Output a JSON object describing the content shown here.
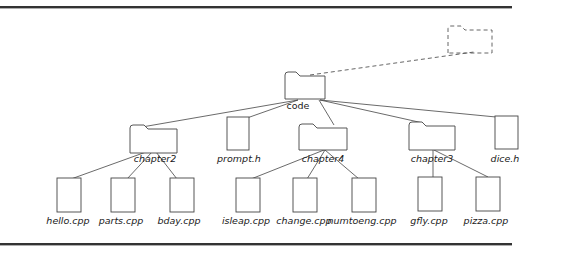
{
  "diagram": {
    "type": "directory-tree",
    "root": {
      "id": "code",
      "label": "code",
      "kind": "folder",
      "parent_placeholder": {
        "kind": "folder",
        "style": "dashed",
        "label": ""
      }
    },
    "nodes": [
      {
        "id": "code",
        "label": "code",
        "kind": "folder",
        "parent": null
      },
      {
        "id": "chapter2",
        "label": "chapter2",
        "kind": "folder",
        "parent": "code"
      },
      {
        "id": "prompt_h",
        "label": "prompt.h",
        "kind": "file",
        "parent": "code"
      },
      {
        "id": "chapter4",
        "label": "chapter4",
        "kind": "folder",
        "parent": "code"
      },
      {
        "id": "chapter3",
        "label": "chapter3",
        "kind": "folder",
        "parent": "code"
      },
      {
        "id": "dice_h",
        "label": "dice.h",
        "kind": "file",
        "parent": "code"
      },
      {
        "id": "hello_cpp",
        "label": "hello.cpp",
        "kind": "file",
        "parent": "chapter2"
      },
      {
        "id": "parts_cpp",
        "label": "parts.cpp",
        "kind": "file",
        "parent": "chapter2"
      },
      {
        "id": "bday_cpp",
        "label": "bday.cpp",
        "kind": "file",
        "parent": "chapter2"
      },
      {
        "id": "isleap_cpp",
        "label": "isleap.cpp",
        "kind": "file",
        "parent": "chapter4"
      },
      {
        "id": "change_cpp",
        "label": "change.cpp",
        "kind": "file",
        "parent": "chapter4"
      },
      {
        "id": "numtoeng_cpp",
        "label": "numtoeng.cpp",
        "kind": "file",
        "parent": "chapter4"
      },
      {
        "id": "gfly_cpp",
        "label": "gfly.cpp",
        "kind": "file",
        "parent": "chapter3"
      },
      {
        "id": "pizza_cpp",
        "label": "pizza.cpp",
        "kind": "file",
        "parent": "chapter3"
      }
    ],
    "colors": {
      "stroke": "#444444",
      "rule": "#333333",
      "text": "#1a1a1a",
      "background": "#ffffff"
    }
  }
}
